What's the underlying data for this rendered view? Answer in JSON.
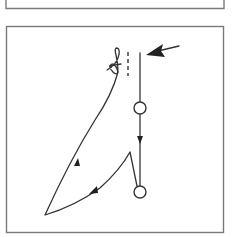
{
  "figure": {
    "type": "line-diagram",
    "colors": {
      "frame": "#7a7a7a",
      "stroke": "#333333",
      "arrow": "#222222",
      "background": "#ffffff"
    },
    "panels": [
      {
        "id": "top-panel",
        "visible": "bottom edge only"
      },
      {
        "id": "main-panel",
        "visible": "full"
      }
    ],
    "elements": {
      "entry_arrow": {
        "direction": "left",
        "style": "filled"
      },
      "vertical_path": {
        "arrow_direction": "down"
      },
      "nodes": [
        {
          "id": "node-1",
          "shape": "circle"
        },
        {
          "id": "node-2",
          "shape": "circle"
        }
      ],
      "return_path": {
        "arrows": [
          "down-left",
          "up"
        ]
      },
      "dashed_marker": {
        "orientation": "vertical"
      },
      "loop_marker": {
        "style": "hand-drawn squiggle"
      }
    }
  }
}
